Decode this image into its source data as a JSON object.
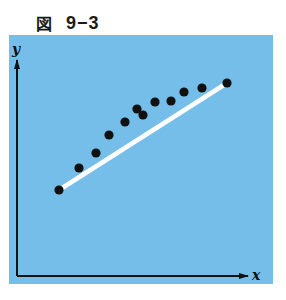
{
  "figure": {
    "title_prefix": "図",
    "title_number": "9−3",
    "panel_color": "#75bee9",
    "axis_color": "#111111",
    "line_color": "#ffffff",
    "point_color": "#111111"
  },
  "axes": {
    "x_label": "x",
    "y_label": "y"
  },
  "chart_data": {
    "type": "scatter",
    "title": "図 9−3",
    "xlabel": "x",
    "ylabel": "y",
    "grid": false,
    "ticks": "none",
    "note": "Pixel coordinates in the 286x300 image; scatter points lie above a straight white line connecting the first and last points.",
    "points": [
      {
        "x": 59,
        "y": 190
      },
      {
        "x": 79,
        "y": 168
      },
      {
        "x": 96,
        "y": 153
      },
      {
        "x": 109,
        "y": 135
      },
      {
        "x": 125,
        "y": 122
      },
      {
        "x": 137,
        "y": 109
      },
      {
        "x": 143,
        "y": 115
      },
      {
        "x": 155,
        "y": 102
      },
      {
        "x": 171,
        "y": 101
      },
      {
        "x": 184,
        "y": 92
      },
      {
        "x": 202,
        "y": 88
      },
      {
        "x": 227,
        "y": 83
      }
    ],
    "line": {
      "x1": 59,
      "y1": 190,
      "x2": 227,
      "y2": 83,
      "color": "#ffffff"
    }
  }
}
